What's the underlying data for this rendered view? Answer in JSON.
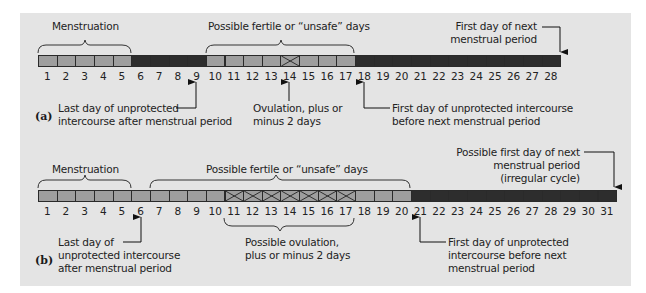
{
  "panel_a": {
    "tag": "(a)",
    "days": [
      1,
      2,
      3,
      4,
      5,
      6,
      7,
      8,
      9,
      10,
      11,
      12,
      13,
      14,
      15,
      16,
      17,
      18,
      19,
      20,
      21,
      22,
      23,
      24,
      25,
      26,
      27,
      28
    ],
    "phases": [
      {
        "from": 1,
        "to": 5,
        "shade": "light"
      },
      {
        "from": 6,
        "to": 9,
        "shade": "dark"
      },
      {
        "from": 10,
        "to": 17,
        "shade": "light"
      },
      {
        "from": 18,
        "to": 28,
        "shade": "dark"
      }
    ],
    "ovulation_cross_days": [
      14
    ],
    "labels": {
      "menstruation": "Menstruation",
      "fertile": "Possible fertile or “unsafe” days",
      "next_period_1": "First day of next",
      "next_period_2": "menstrual period",
      "last_day_1": "Last day of unprotected",
      "last_day_2": "intercourse after menstrual period",
      "ovulation_1": "Ovulation, plus or",
      "ovulation_2": "minus 2 days",
      "first_day_1": "First day of unprotected intercourse",
      "first_day_2": "before next menstrual period"
    }
  },
  "panel_b": {
    "tag": "(b)",
    "days": [
      1,
      2,
      3,
      4,
      5,
      6,
      7,
      8,
      9,
      10,
      11,
      12,
      13,
      14,
      15,
      16,
      17,
      18,
      19,
      20,
      21,
      22,
      23,
      24,
      25,
      26,
      27,
      28,
      29,
      30,
      31
    ],
    "phases": [
      {
        "from": 1,
        "to": 20,
        "shade": "light"
      },
      {
        "from": 21,
        "to": 31,
        "shade": "dark"
      }
    ],
    "ovulation_cross_days": [
      11,
      12,
      13,
      14,
      15,
      16,
      17
    ],
    "labels": {
      "menstruation": "Menstruation",
      "fertile": "Possible fertile or “unsafe” days",
      "next_period_1": "Possible first day of next",
      "next_period_2": "menstrual period",
      "next_period_3": "(irregular cycle)",
      "last_day_1": "Last day of",
      "last_day_2": "unprotected intercourse",
      "last_day_3": "after menstrual period",
      "ovulation_1": "Possible ovulation,",
      "ovulation_2": "plus or minus 2 days",
      "first_day_1": "First day of unprotected",
      "first_day_2": "intercourse before next",
      "first_day_3": "menstrual period"
    }
  },
  "colors": {
    "panel_bg": "#e4e4e4",
    "light_cell": "#9e9e9e",
    "dark_cell": "#2d2d2d",
    "line": "#2a2a2a"
  }
}
